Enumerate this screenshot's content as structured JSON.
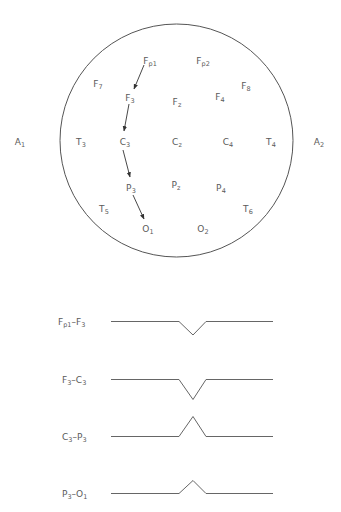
{
  "head": {
    "center": [
      176.5,
      140.5
    ],
    "radius": 116.5,
    "stroke_color": "#555555"
  },
  "electrodes": [
    {
      "id": "Fp1",
      "main": "F",
      "sub": "p1",
      "x": 150,
      "y": 61
    },
    {
      "id": "Fp2",
      "main": "F",
      "sub": "p2",
      "x": 203,
      "y": 61
    },
    {
      "id": "F7",
      "main": "F",
      "sub": "7",
      "x": 98,
      "y": 84
    },
    {
      "id": "F8",
      "main": "F",
      "sub": "8",
      "x": 246,
      "y": 86
    },
    {
      "id": "F3",
      "main": "F",
      "sub": "3",
      "x": 130,
      "y": 98
    },
    {
      "id": "Fz",
      "main": "F",
      "sub": "z",
      "x": 177,
      "y": 102
    },
    {
      "id": "F4",
      "main": "F",
      "sub": "4",
      "x": 220,
      "y": 97
    },
    {
      "id": "A1",
      "main": "A",
      "sub": "1",
      "x": 20,
      "y": 142
    },
    {
      "id": "T3",
      "main": "T",
      "sub": "3",
      "x": 81,
      "y": 142
    },
    {
      "id": "C3",
      "main": "C",
      "sub": "3",
      "x": 125,
      "y": 142
    },
    {
      "id": "Cz",
      "main": "C",
      "sub": "z",
      "x": 177,
      "y": 142
    },
    {
      "id": "C4",
      "main": "C",
      "sub": "4",
      "x": 228,
      "y": 142
    },
    {
      "id": "T4",
      "main": "T",
      "sub": "4",
      "x": 271,
      "y": 142
    },
    {
      "id": "A2",
      "main": "A",
      "sub": "2",
      "x": 319,
      "y": 142
    },
    {
      "id": "P3",
      "main": "P",
      "sub": "3",
      "x": 131,
      "y": 188
    },
    {
      "id": "Pz",
      "main": "P",
      "sub": "z",
      "x": 176,
      "y": 185
    },
    {
      "id": "P4",
      "main": "P",
      "sub": "4",
      "x": 221,
      "y": 188
    },
    {
      "id": "T5",
      "main": "T",
      "sub": "5",
      "x": 104,
      "y": 209
    },
    {
      "id": "T6",
      "main": "T",
      "sub": "6",
      "x": 248,
      "y": 209
    },
    {
      "id": "O1",
      "main": "O",
      "sub": "1",
      "x": 148,
      "y": 229
    },
    {
      "id": "O2",
      "main": "O",
      "sub": "2",
      "x": 203,
      "y": 229
    }
  ],
  "arrows": [
    {
      "from": "Fp1",
      "to": "F3",
      "x1": 144,
      "y1": 65,
      "x2": 134,
      "y2": 89
    },
    {
      "from": "F3",
      "to": "C3",
      "x1": 129,
      "y1": 104,
      "x2": 124,
      "y2": 131
    },
    {
      "from": "C3",
      "to": "P3",
      "x1": 123,
      "y1": 150,
      "x2": 130,
      "y2": 177
    },
    {
      "from": "P3",
      "to": "O1",
      "x1": 133,
      "y1": 195,
      "x2": 144,
      "y2": 219
    }
  ],
  "traces": [
    {
      "label_main_a": "F",
      "label_sub_a": "p1",
      "label_main_b": "F",
      "label_sub_b": "3",
      "label_x": 58,
      "baseline": 321.5,
      "points": [
        [
          111,
          321.5
        ],
        [
          179,
          321.5
        ],
        [
          193,
          335
        ],
        [
          206,
          321.5
        ],
        [
          273,
          321.5
        ]
      ]
    },
    {
      "label_main_a": "F",
      "label_sub_a": "3",
      "label_main_b": "C",
      "label_sub_b": "3",
      "label_x": 62,
      "baseline": 379.5,
      "points": [
        [
          111,
          379.5
        ],
        [
          179,
          379.5
        ],
        [
          193,
          399.5
        ],
        [
          206,
          379.5
        ],
        [
          273,
          379.5
        ]
      ]
    },
    {
      "label_main_a": "C",
      "label_sub_a": "3",
      "label_main_b": "P",
      "label_sub_b": "3",
      "label_x": 62,
      "baseline": 436.5,
      "points": [
        [
          111,
          436.5
        ],
        [
          179,
          436.5
        ],
        [
          193,
          416.5
        ],
        [
          206,
          436.5
        ],
        [
          273,
          436.5
        ]
      ]
    },
    {
      "label_main_a": "P",
      "label_sub_a": "3",
      "label_main_b": "O",
      "label_sub_b": "1",
      "label_x": 62,
      "baseline": 493.5,
      "points": [
        [
          111,
          493.5
        ],
        [
          179,
          493.5
        ],
        [
          193,
          480.5
        ],
        [
          206,
          493.5
        ],
        [
          273,
          493.5
        ]
      ]
    }
  ],
  "dash": "–"
}
